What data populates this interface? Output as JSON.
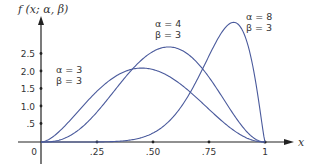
{
  "chart_data": {
    "type": "line",
    "title": "",
    "ylabel": "f (x; α, β)",
    "xlabel": "x",
    "xlim": [
      0,
      1
    ],
    "ylim": [
      0,
      3.5
    ],
    "grid": false,
    "x_ticks": [
      "0",
      ".25",
      ".50",
      ".75",
      "1"
    ],
    "y_ticks": [
      ".5",
      "1.0",
      "1.5",
      "2.0",
      "2.5"
    ],
    "series": [
      {
        "name": "α = 3, β = 3",
        "alpha": 3,
        "beta": 3,
        "peak_x": 0.45,
        "peak_y": 2.1,
        "label_line1": "α = 3",
        "label_line2": "β = 3"
      },
      {
        "name": "α = 4, β = 3",
        "alpha": 4,
        "beta": 3,
        "peak_x": 0.57,
        "peak_y": 2.7,
        "label_line1": "α = 4",
        "label_line2": "β = 3"
      },
      {
        "name": "α = 8, β = 3",
        "alpha": 8,
        "beta": 3,
        "peak_x": 0.86,
        "peak_y": 3.4,
        "label_line1": "α = 8",
        "label_line2": "β = 3"
      }
    ],
    "line_color": "#4a5a9c",
    "axis_color": "#222222"
  }
}
